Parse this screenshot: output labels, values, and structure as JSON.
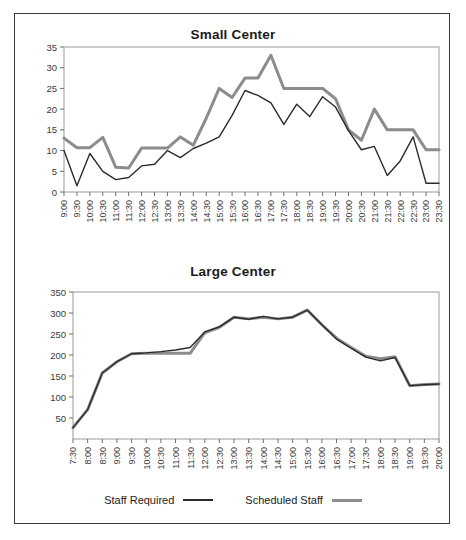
{
  "figure": {
    "border_color": "#3a3a3a",
    "background": "#ffffff"
  },
  "legend": {
    "items": [
      {
        "label": "Staff Required",
        "color": "#2b2b2b",
        "width": 2
      },
      {
        "label": "Scheduled Staff",
        "color": "#8c8c8c",
        "width": 3
      }
    ]
  },
  "chart_data": [
    {
      "type": "line",
      "title": "Small Center",
      "xlabel": "",
      "ylabel": "",
      "ylim": [
        0,
        35
      ],
      "yticks": [
        0,
        5,
        10,
        15,
        20,
        25,
        30,
        35
      ],
      "grid": false,
      "legend_position": "bottom-shared",
      "categories": [
        "9:00",
        "9:30",
        "10:00",
        "10:30",
        "11:00",
        "11:30",
        "12:00",
        "12:30",
        "13:00",
        "13:30",
        "14:00",
        "14:30",
        "15:00",
        "15:30",
        "16:00",
        "16:30",
        "17:00",
        "17:30",
        "18:00",
        "18:30",
        "19:00",
        "19:30",
        "20:00",
        "20:30",
        "21:00",
        "21:30",
        "22:00",
        "22:30",
        "23:00",
        "23:30"
      ],
      "series": [
        {
          "name": "Staff Required",
          "color": "#2b2b2b",
          "values": [
            10,
            1.5,
            9.3,
            5,
            3,
            3.5,
            6.3,
            6.7,
            10,
            8.3,
            10.5,
            11.8,
            13.3,
            18.5,
            24.5,
            23.3,
            21.5,
            16.3,
            21.2,
            18.2,
            23,
            20.5,
            14.8,
            10.2,
            11,
            4,
            7.5,
            13.3,
            2.1,
            2.1
          ]
        },
        {
          "name": "Scheduled Staff",
          "color": "#8c8c8c",
          "values": [
            13,
            10.7,
            10.7,
            13.2,
            6,
            5.8,
            10.6,
            10.6,
            10.6,
            13.3,
            11.3,
            17.8,
            25,
            22.8,
            27.5,
            27.5,
            33,
            25,
            25,
            25,
            25,
            22.5,
            15,
            12.5,
            20,
            15,
            15,
            15,
            10.2,
            10.2
          ]
        }
      ]
    },
    {
      "type": "line",
      "title": "Large Center",
      "xlabel": "",
      "ylabel": "",
      "ylim": [
        0,
        350
      ],
      "yticks": [
        50,
        100,
        150,
        200,
        250,
        300,
        350
      ],
      "grid": false,
      "legend_position": "bottom",
      "categories": [
        "7:30",
        "8:00",
        "8:30",
        "9:00",
        "9:30",
        "10:00",
        "10:30",
        "11:00",
        "11:30",
        "12:00",
        "12:30",
        "13:00",
        "13:30",
        "14:00",
        "14:30",
        "15:00",
        "15:30",
        "16:00",
        "16:30",
        "17:00",
        "17:30",
        "18:00",
        "18:30",
        "19:00",
        "19:30",
        "20:00"
      ],
      "series": [
        {
          "name": "Staff Required",
          "color": "#2b2b2b",
          "values": [
            27,
            70,
            157,
            184,
            203,
            205,
            208,
            212,
            218,
            255,
            267,
            290,
            285,
            292,
            286,
            290,
            307,
            272,
            238,
            216,
            195,
            186,
            194,
            127,
            129,
            131
          ]
        },
        {
          "name": "Scheduled Staff",
          "color": "#8c8c8c",
          "values": [
            27,
            70,
            157,
            184,
            203,
            204,
            204,
            204,
            204,
            253,
            266,
            290,
            286,
            290,
            286,
            290,
            307,
            272,
            240,
            218,
            197,
            191,
            196,
            127,
            130,
            131
          ]
        }
      ]
    }
  ]
}
